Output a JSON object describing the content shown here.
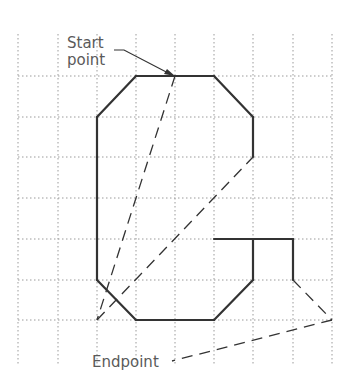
{
  "diagram": {
    "type": "cad-path-drawing",
    "grid": {
      "x": [
        18,
        58,
        97,
        136,
        175,
        214,
        253,
        293,
        332
      ],
      "y": [
        76,
        117,
        157,
        198,
        239,
        280,
        320
      ],
      "x_extent": [
        18,
        332
      ],
      "y_extent": [
        34,
        366
      ],
      "color": "#9a9a9a"
    },
    "shape": {
      "color": "#333333",
      "segments": [
        [
          [
            136,
            76
          ],
          [
            214,
            76
          ]
        ],
        [
          [
            214,
            76
          ],
          [
            253,
            117
          ]
        ],
        [
          [
            253,
            117
          ],
          [
            253,
            157
          ]
        ],
        [
          [
            136,
            76
          ],
          [
            97,
            117
          ]
        ],
        [
          [
            97,
            117
          ],
          [
            97,
            280
          ]
        ],
        [
          [
            97,
            280
          ],
          [
            136,
            320
          ]
        ],
        [
          [
            136,
            320
          ],
          [
            214,
            320
          ]
        ],
        [
          [
            214,
            320
          ],
          [
            253,
            280
          ]
        ],
        [
          [
            253,
            280
          ],
          [
            253,
            239
          ]
        ],
        [
          [
            214,
            239
          ],
          [
            293,
            239
          ]
        ],
        [
          [
            293,
            239
          ],
          [
            293,
            280
          ]
        ]
      ]
    },
    "dashed_paths": [
      [
        [
          175,
          76
        ],
        [
          97,
          320
        ]
      ],
      [
        [
          97,
          320
        ],
        [
          253,
          157
        ]
      ],
      [
        [
          293,
          280
        ],
        [
          332,
          320
        ]
      ],
      [
        [
          332,
          320
        ],
        [
          172,
          361
        ]
      ]
    ],
    "labels": {
      "start_line1": "Start",
      "start_line2": "point",
      "end": "Endpoint"
    },
    "start_point": [
      175,
      76
    ],
    "end_point": [
      332,
      320
    ]
  }
}
